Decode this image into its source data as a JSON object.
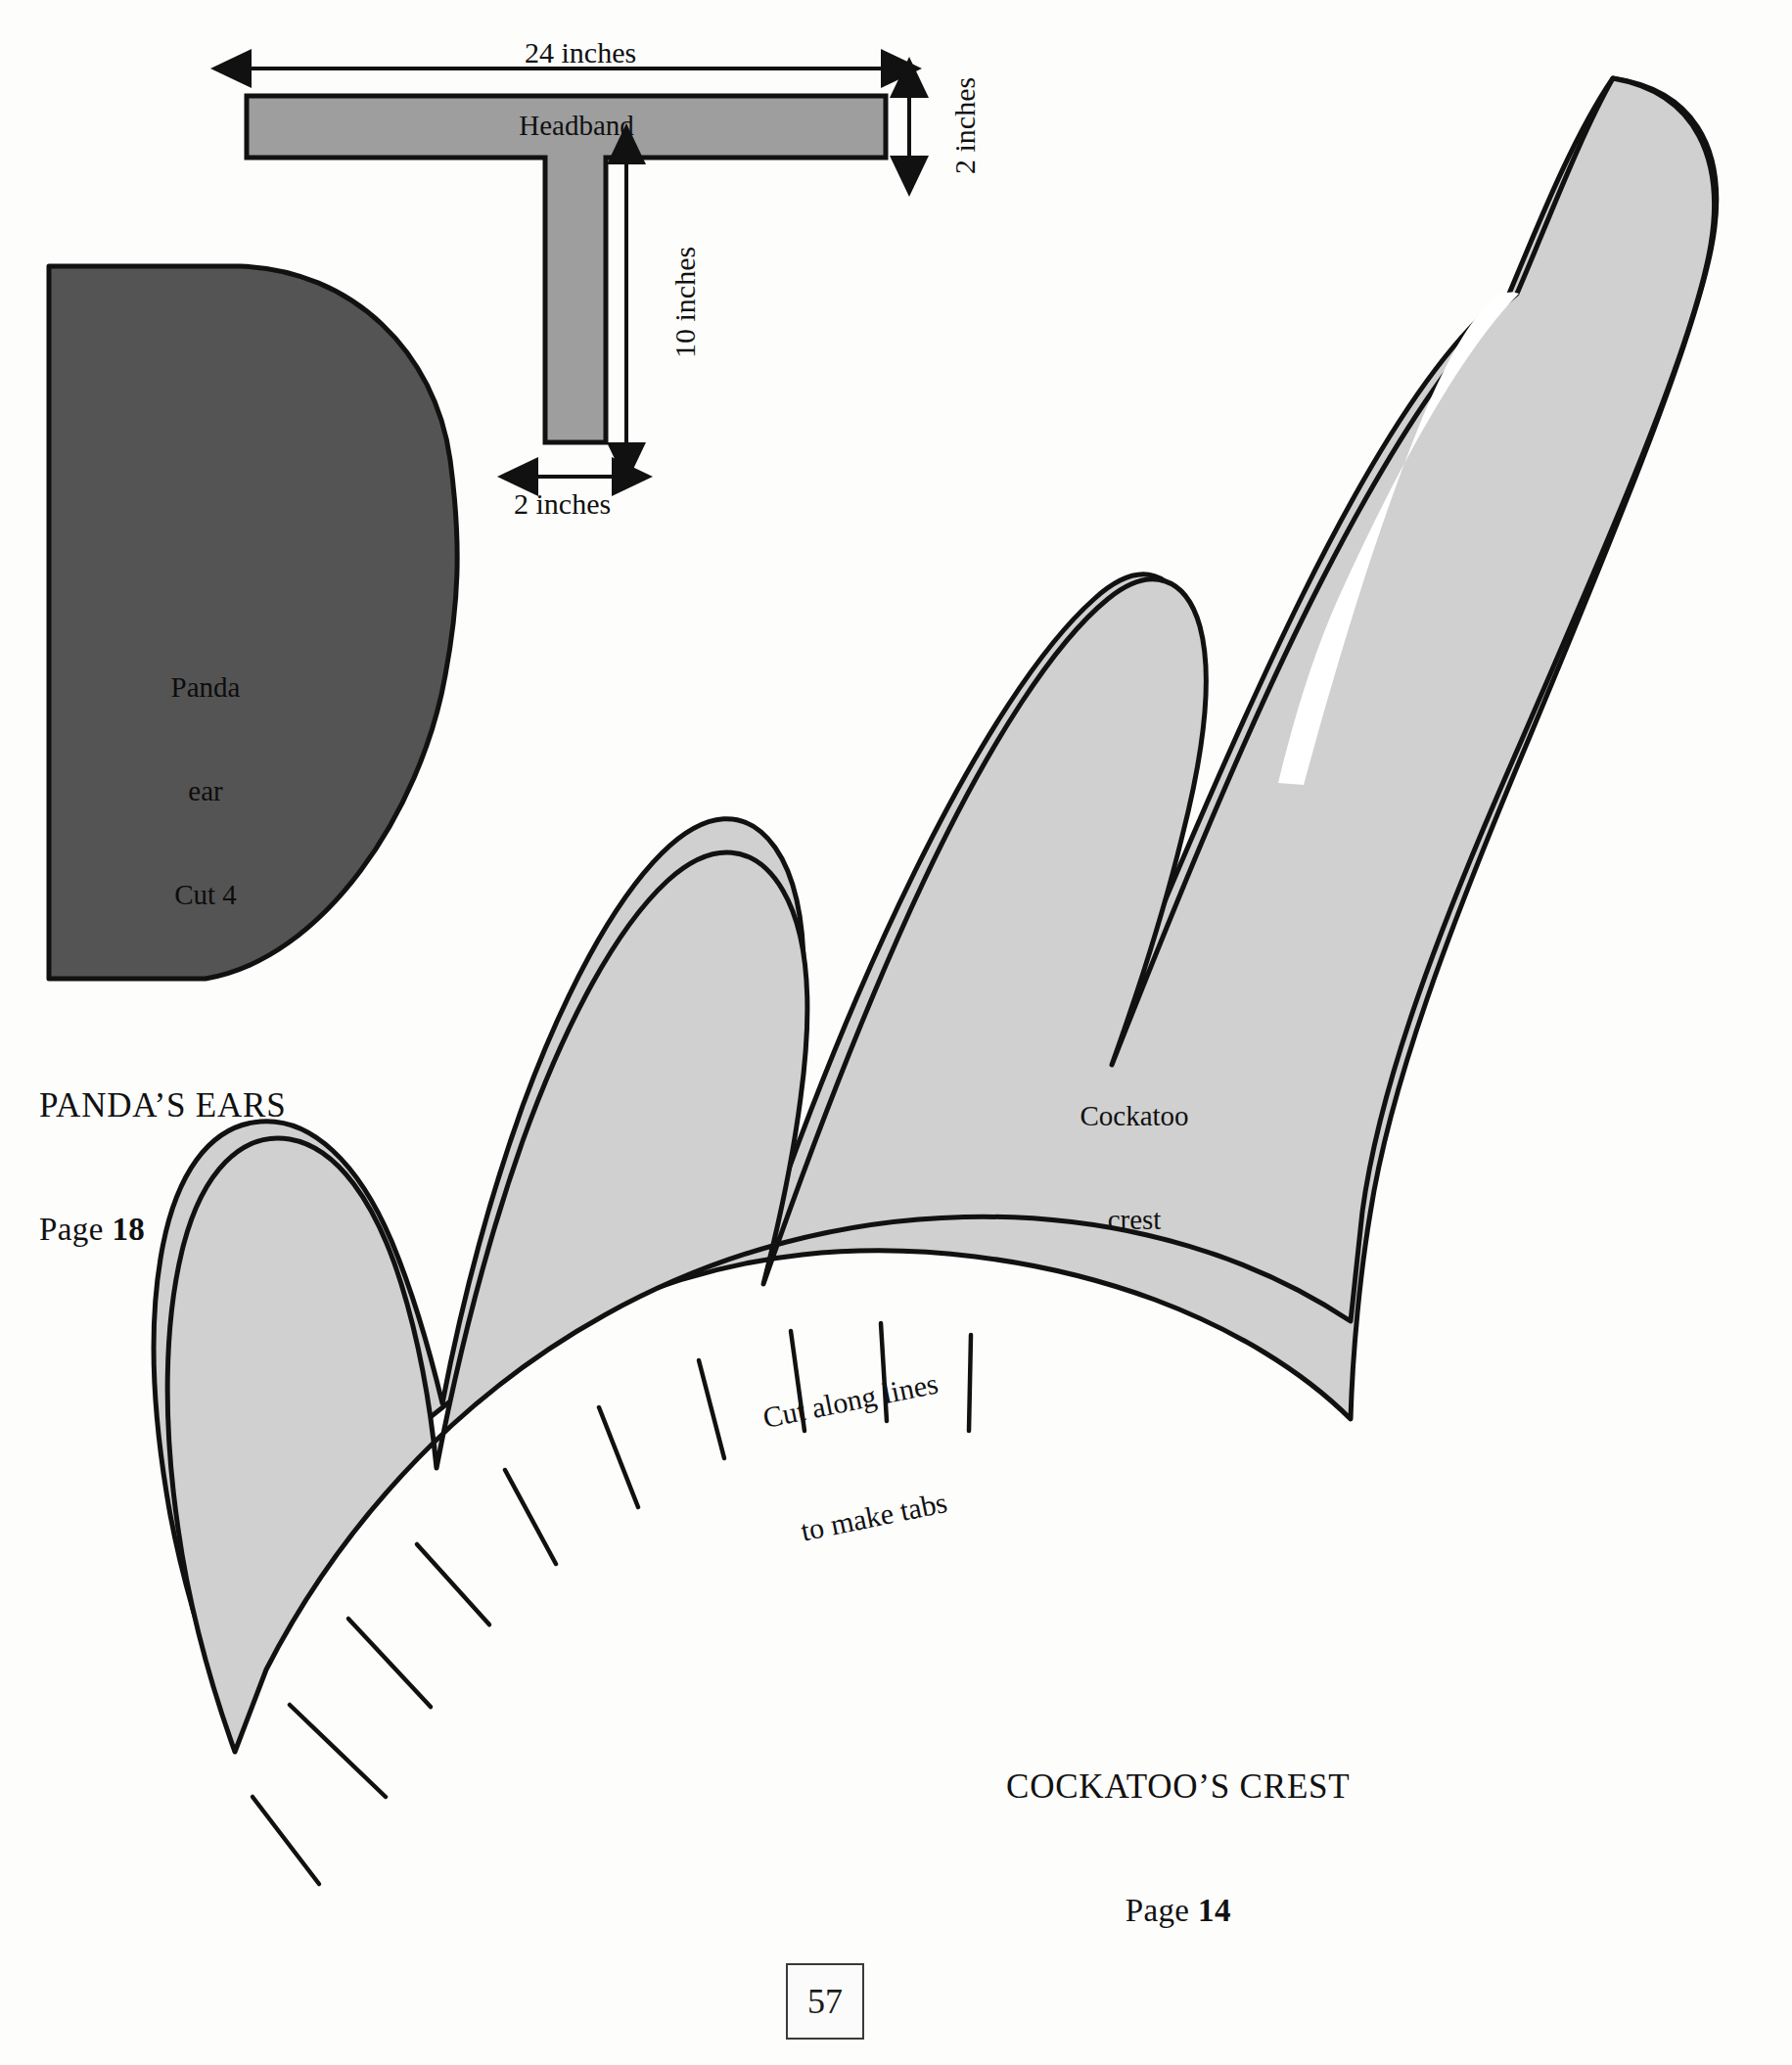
{
  "page": {
    "number": "57",
    "background_color": "#fdfdfc"
  },
  "colors": {
    "headband_fill": "#9e9e9e",
    "panda_ear_fill": "#545454",
    "cockatoo_crest_fill": "#d0d0d0",
    "outline": "#111111",
    "text": "#111111"
  },
  "headband": {
    "label": "Headband",
    "dimensions": {
      "width_label": "24 inches",
      "height_label": "2 inches",
      "stem_length_label": "10 inches",
      "stem_width_label": "2 inches"
    }
  },
  "panda_ear": {
    "shape_label_line1": "Panda",
    "shape_label_line2": "ear",
    "shape_label_line3": "Cut 4",
    "caption_title": "PANDA’S EARS",
    "caption_page_word": "Page",
    "caption_page_number": "18"
  },
  "cockatoo_crest": {
    "shape_label_line1": "Cockatoo",
    "shape_label_line2": "crest",
    "tabs_note_line1": "Cut along lines",
    "tabs_note_line2": "to make tabs",
    "caption_title": "COCKATOO’S CREST",
    "caption_page_word": "Page",
    "caption_page_number": "14"
  }
}
